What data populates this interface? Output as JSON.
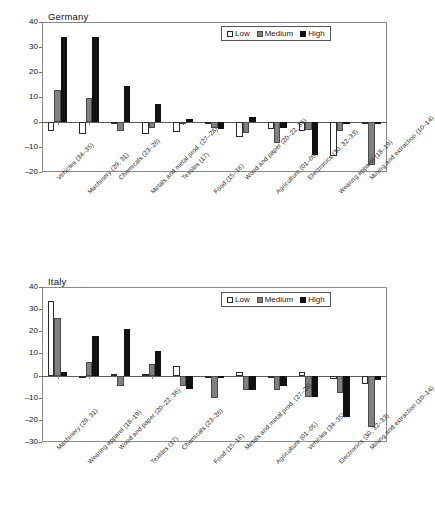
{
  "figure": {
    "background": "#ffffff",
    "series_colors": {
      "low": "#ffffff",
      "medium": "#808080",
      "high": "#111111"
    }
  },
  "legend": {
    "low": "Low",
    "medium": "Medium",
    "high": "High"
  },
  "chart_data": [
    {
      "type": "bar",
      "title": "Germany",
      "xlabel": "",
      "ylabel": "",
      "ylim": [
        -20,
        40
      ],
      "yticks": [
        -20,
        -10,
        0,
        10,
        20,
        30,
        40
      ],
      "ytick_labels": [
        "-20",
        "-10",
        "0",
        "10",
        "20",
        "30",
        "40"
      ],
      "grid": false,
      "legend_position": "top-right",
      "categories": [
        "Vehicles (34–35)",
        "Machinery (29, 31)",
        "Chemicals (23–26)",
        "Metals and metal prod. (27–28)",
        "Textiles (17)",
        "Food (15–16)",
        "Wood and paper (20–22, 36)",
        "Agriculture (01–05)",
        "Electronics (30, 32–33)",
        "Wearing apparel (18–19)",
        "Mining and extraction (10–14)"
      ],
      "series": [
        {
          "name": "Low",
          "values": [
            -3.7,
            -4.6,
            -0.6,
            -4.7,
            -4.0,
            -0.4,
            -6.1,
            -2.9,
            -3.4,
            -13.5,
            -0.3
          ]
        },
        {
          "name": "Medium",
          "values": [
            12.9,
            9.7,
            -3.6,
            -2.3,
            -0.9,
            -2.3,
            -4.3,
            -8.3,
            -3.0,
            -3.6,
            -17.3
          ]
        },
        {
          "name": "High",
          "values": [
            34.2,
            34.0,
            14.4,
            7.3,
            1.2,
            -2.6,
            2.1,
            -2.4,
            -13.1,
            -0.5,
            -0.3
          ]
        }
      ]
    },
    {
      "type": "bar",
      "title": "Italy",
      "xlabel": "",
      "ylabel": "",
      "ylim": [
        -30,
        40
      ],
      "yticks": [
        -30,
        -20,
        -10,
        0,
        10,
        20,
        30,
        40
      ],
      "ytick_labels": [
        "-30",
        "-20",
        "-10",
        "0",
        "10",
        "20",
        "30",
        "40"
      ],
      "grid": false,
      "legend_position": "top-right",
      "categories": [
        "Machinery (29, 31)",
        "Wearing apparel (18–19)",
        "Wood and paper (20–22, 36)",
        "Textiles (17)",
        "Chemicals (23–26)",
        "Food (15–16)",
        "Metals and metal prod. (27–28)",
        "Agriculture (01–05)",
        "Vehicles (34–35)",
        "Electronics (30, 32–33)",
        "Mining and extraction (10–14)"
      ],
      "series": [
        {
          "name": "Low",
          "values": [
            33.5,
            -0.4,
            0.9,
            0.5,
            4.2,
            -0.3,
            1.5,
            -0.6,
            1.6,
            -1.7,
            -3.6
          ]
        },
        {
          "name": "Medium",
          "values": [
            25.8,
            6.1,
            -4.6,
            5.4,
            -4.5,
            -10.2,
            -6.6,
            -6.5,
            -9.6,
            -7.9,
            -23.2
          ]
        },
        {
          "name": "High",
          "values": [
            1.5,
            18.0,
            21.2,
            11.3,
            -5.9,
            -0.3,
            -6.3,
            -4.5,
            -9.9,
            -18.8,
            -1.8
          ]
        }
      ]
    }
  ]
}
